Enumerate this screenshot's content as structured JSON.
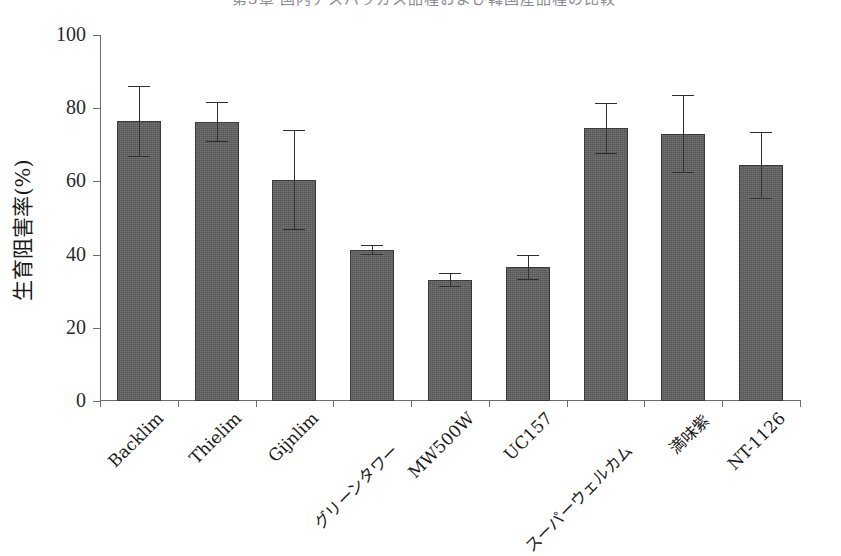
{
  "caption": {
    "text": "第3章 国内アスパラガス品種および韓国産品種の比較"
  },
  "chart_data": {
    "type": "bar",
    "title": "",
    "xlabel": "",
    "ylabel": "生育阻害率(%)",
    "ylim": [
      0,
      100
    ],
    "yticks": [
      0,
      20,
      40,
      60,
      80,
      100
    ],
    "ytick_labels": [
      "0",
      "20",
      "40",
      "60",
      "80",
      "100"
    ],
    "grid": false,
    "legend": "none",
    "error_bars": "symmetric-sd",
    "bar_color": "#565656",
    "categories": [
      "Backlim",
      "Thielim",
      "Gijnlim",
      "グリーンタワー",
      "MW500W",
      "UC157",
      "スーパーウェルカム",
      "満味紫",
      "NT-1126"
    ],
    "values": [
      76.5,
      76.3,
      60.5,
      41.3,
      33.2,
      36.6,
      74.5,
      73.0,
      64.6
    ],
    "err_upper": [
      9.5,
      5.3,
      13.5,
      1.2,
      1.8,
      3.3,
      6.8,
      10.5,
      9.0
    ],
    "err_lower": [
      9.5,
      5.3,
      13.5,
      1.2,
      1.8,
      3.3,
      6.8,
      10.5,
      9.0
    ],
    "ci_top": [
      86.0,
      81.6,
      74.0,
      42.5,
      35.0,
      39.9,
      81.3,
      83.5,
      73.6
    ],
    "ci_bottom": [
      67.0,
      71.0,
      47.0,
      40.1,
      31.4,
      33.3,
      67.7,
      62.5,
      55.6
    ]
  }
}
